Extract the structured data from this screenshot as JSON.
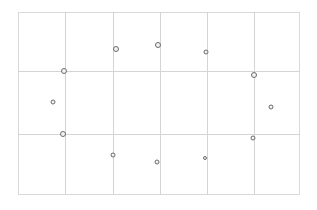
{
  "diagram": {
    "type": "grid-with-markers",
    "frame": {
      "left": 18,
      "top": 12,
      "right": 300,
      "bottom": 195
    },
    "grid": {
      "vertical_lines_x": [
        65,
        113,
        160,
        207,
        254
      ],
      "horizontal_lines_y": [
        71,
        134
      ],
      "line_color": "#d4d4d4"
    },
    "marker_style": {
      "stroke": "#6b6b6b",
      "fill": "#f3f3f3"
    },
    "markers": [
      {
        "id": 1,
        "x": 64,
        "y": 71,
        "r": 6
      },
      {
        "id": 2,
        "x": 116,
        "y": 49,
        "r": 6
      },
      {
        "id": 3,
        "x": 158,
        "y": 45,
        "r": 6
      },
      {
        "id": 4,
        "x": 206,
        "y": 52,
        "r": 5
      },
      {
        "id": 5,
        "x": 254,
        "y": 75,
        "r": 6
      },
      {
        "id": 6,
        "x": 271,
        "y": 107,
        "r": 5
      },
      {
        "id": 7,
        "x": 253,
        "y": 138,
        "r": 5
      },
      {
        "id": 8,
        "x": 205,
        "y": 158,
        "r": 4
      },
      {
        "id": 9,
        "x": 157,
        "y": 162,
        "r": 5
      },
      {
        "id": 10,
        "x": 113,
        "y": 155,
        "r": 5
      },
      {
        "id": 11,
        "x": 63,
        "y": 134,
        "r": 6
      },
      {
        "id": 12,
        "x": 53,
        "y": 102,
        "r": 5
      }
    ]
  }
}
